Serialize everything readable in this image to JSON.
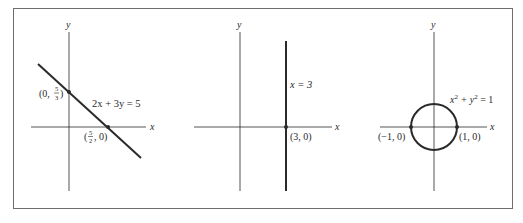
{
  "figure": {
    "frame_color": "#6e6e6e",
    "ink_color": "#2a2a2a",
    "panels": [
      {
        "id": "line",
        "axis_x_label": "x",
        "axis_y_label": "y",
        "equation": "2x + 3y = 5",
        "points": [
          {
            "label_prefix": "(0, ",
            "label_num": "5",
            "label_den": "3",
            "label_suffix": ")"
          },
          {
            "label_prefix": "(",
            "label_num": "5",
            "label_den": "2",
            "label_suffix": ", 0)"
          }
        ]
      },
      {
        "id": "vertical-line",
        "axis_x_label": "x",
        "axis_y_label": "y",
        "equation": "x = 3",
        "points": [
          {
            "label": "(3, 0)"
          }
        ]
      },
      {
        "id": "circle",
        "axis_x_label": "x",
        "axis_y_label": "y",
        "equation_base1": "x",
        "equation_exp1": "2",
        "equation_mid": " + y",
        "equation_exp2": "2",
        "equation_end": " = 1",
        "points": [
          {
            "label": "(−1, 0)"
          },
          {
            "label": "(1, 0)"
          }
        ]
      }
    ]
  }
}
